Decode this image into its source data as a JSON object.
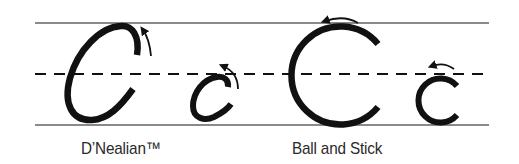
{
  "colors": {
    "guide_line": "#8a8a8a",
    "stroke": "#111111",
    "text": "#2a2a2a",
    "background": "#ffffff"
  },
  "guidelines": {
    "top_y": 23,
    "mid_y": 74,
    "bottom_y": 125,
    "x_start": 35,
    "x_end": 489,
    "mid_style": "dashed"
  },
  "styles": [
    {
      "name": "D'Nealian",
      "caption": "D’Nealian™",
      "letters": [
        {
          "char": "C",
          "case": "uppercase",
          "form": "slanted oval",
          "stroke_direction": "counterclockwise",
          "arrow": "curved arrow up-left at start"
        },
        {
          "char": "c",
          "case": "lowercase",
          "form": "slanted oval",
          "stroke_direction": "counterclockwise",
          "arrow": "curved arrow up-left at start"
        }
      ]
    },
    {
      "name": "Ball and Stick",
      "caption": "Ball and Stick",
      "letters": [
        {
          "char": "C",
          "case": "uppercase",
          "form": "circle arc",
          "stroke_direction": "counterclockwise",
          "arrow": "arrow pointing left above top"
        },
        {
          "char": "c",
          "case": "lowercase",
          "form": "circle arc",
          "stroke_direction": "counterclockwise",
          "arrow": "arrow pointing left above top"
        }
      ]
    }
  ]
}
